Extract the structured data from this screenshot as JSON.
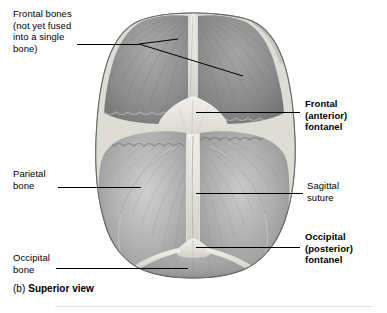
{
  "figure": {
    "caption_letter": "(b)",
    "caption_text": "Superior view",
    "view": "Superior view of fetal skull"
  },
  "labels": {
    "frontal_bones": "Frontal bones\n(not yet fused\ninto a single\nbone)",
    "frontal_fontanel": "Frontal\n(anterior)\nfontanel",
    "parietal_bone": "Parietal\nbone",
    "sagittal_suture": "Sagittal\nsuture",
    "occipital_fontanel": "Occipital\n(posterior)\nfontanel",
    "occipital_bone": "Occipital\nbone"
  },
  "colors": {
    "background": "#ffffff",
    "text": "#000000",
    "leader_line": "#000000",
    "divider": "#e3e3e3",
    "bone_dark": "#7c7c7c",
    "bone_mid": "#9a9a9a",
    "bone_light": "#b8b8b8",
    "suture_light": "#e8e8e4",
    "outline": "#6a6a6a"
  },
  "anatomy": {
    "parts": [
      "left frontal bone",
      "right frontal bone",
      "left parietal bone",
      "right parietal bone",
      "occipital bone",
      "frontal (anterior) fontanel",
      "occipital (posterior) fontanel",
      "sagittal suture",
      "coronal suture",
      "frontal (metopic) suture",
      "lambdoid suture"
    ]
  }
}
